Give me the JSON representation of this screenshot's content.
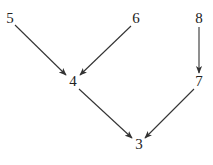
{
  "diagram": {
    "type": "directed-graph",
    "edge_color": "#333333",
    "text_color": "#222222",
    "nodes": [
      {
        "id": "5",
        "label": "5",
        "x": 10,
        "y": 19
      },
      {
        "id": "6",
        "label": "6",
        "x": 136,
        "y": 19
      },
      {
        "id": "8",
        "label": "8",
        "x": 199,
        "y": 19
      },
      {
        "id": "4",
        "label": "4",
        "x": 73,
        "y": 82
      },
      {
        "id": "7",
        "label": "7",
        "x": 199,
        "y": 82
      },
      {
        "id": "3",
        "label": "3",
        "x": 139,
        "y": 145
      }
    ],
    "edges": [
      {
        "from": "5",
        "to": "4",
        "x1": 15,
        "y1": 25,
        "x2": 66,
        "y2": 75
      },
      {
        "from": "6",
        "to": "4",
        "x1": 131,
        "y1": 26,
        "x2": 80,
        "y2": 75
      },
      {
        "from": "8",
        "to": "7",
        "x1": 199,
        "y1": 27,
        "x2": 199,
        "y2": 73
      },
      {
        "from": "4",
        "to": "3",
        "x1": 79,
        "y1": 89,
        "x2": 132,
        "y2": 138
      },
      {
        "from": "7",
        "to": "3",
        "x1": 194,
        "y1": 89,
        "x2": 145,
        "y2": 138
      }
    ]
  }
}
